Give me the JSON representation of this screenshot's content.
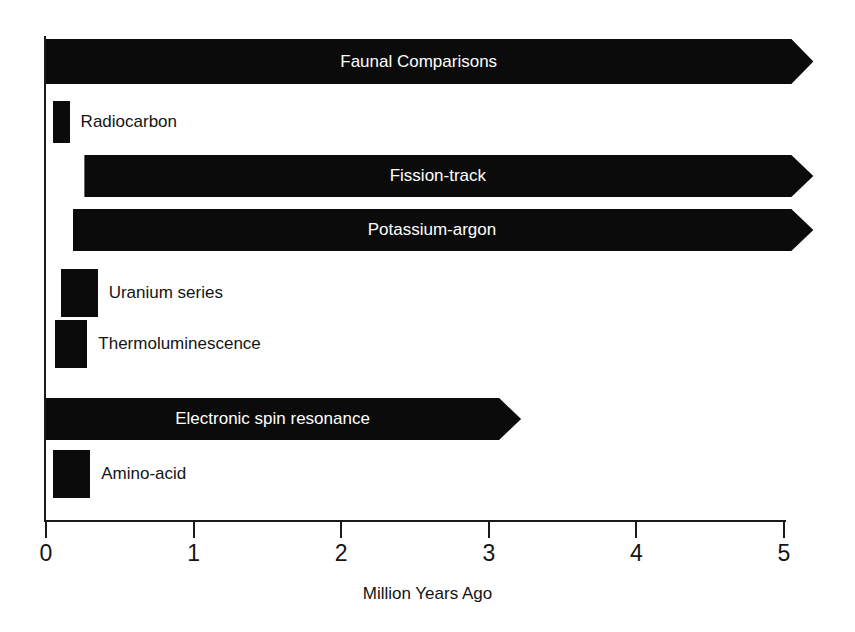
{
  "chart_data": {
    "type": "bar",
    "title": "",
    "subtitle": "",
    "xlabel": "Million Years Ago",
    "ylabel": "",
    "xlim": [
      0,
      5
    ],
    "xticks": [
      0,
      1,
      2,
      3,
      4,
      5
    ],
    "xtick_labels": [
      "0",
      "1",
      "2",
      "3",
      "4",
      "5"
    ],
    "grid": false,
    "legend": "none",
    "orientation": "horizontal",
    "note": "Horizontal range bars show the applicable dating span of each technique. An arrowhead at the right end means the method's range continues beyond the plotted value.",
    "categories": [
      "Faunal Comparisons",
      "Radiocarbon",
      "Fission-track",
      "Potassium-argon",
      "Uranium series",
      "Thermoluminescence",
      "Electronic spin resonance",
      "Amino-acid"
    ],
    "ranges": [
      {
        "label": "Faunal Comparisons",
        "start": 0.0,
        "end": 5.05,
        "open_ended": true,
        "label_position": "inside"
      },
      {
        "label": "Radiocarbon",
        "start": 0.05,
        "end": 0.16,
        "open_ended": false,
        "label_position": "outside"
      },
      {
        "label": "Fission-track",
        "start": 0.26,
        "end": 5.05,
        "open_ended": true,
        "label_position": "inside"
      },
      {
        "label": "Potassium-argon",
        "start": 0.18,
        "end": 5.05,
        "open_ended": true,
        "label_position": "inside"
      },
      {
        "label": "Uranium series",
        "start": 0.1,
        "end": 0.35,
        "open_ended": false,
        "label_position": "outside"
      },
      {
        "label": "Thermoluminescence",
        "start": 0.06,
        "end": 0.28,
        "open_ended": false,
        "label_position": "outside"
      },
      {
        "label": "Electronic spin resonance",
        "start": 0.0,
        "end": 3.07,
        "open_ended": true,
        "label_position": "inside"
      },
      {
        "label": "Amino-acid",
        "start": 0.05,
        "end": 0.3,
        "open_ended": false,
        "label_position": "outside"
      }
    ],
    "values": [
      5.05,
      0.16,
      5.05,
      5.05,
      0.35,
      0.28,
      3.07,
      0.3
    ],
    "bar_color": "#0b0b0b",
    "label_color_inside": "#ffffff",
    "label_color_outside": "#141414",
    "background": "#ffffff"
  },
  "axis": {
    "xlabel": "Million Years Ago",
    "ticks": [
      "0",
      "1",
      "2",
      "3",
      "4",
      "5"
    ]
  }
}
